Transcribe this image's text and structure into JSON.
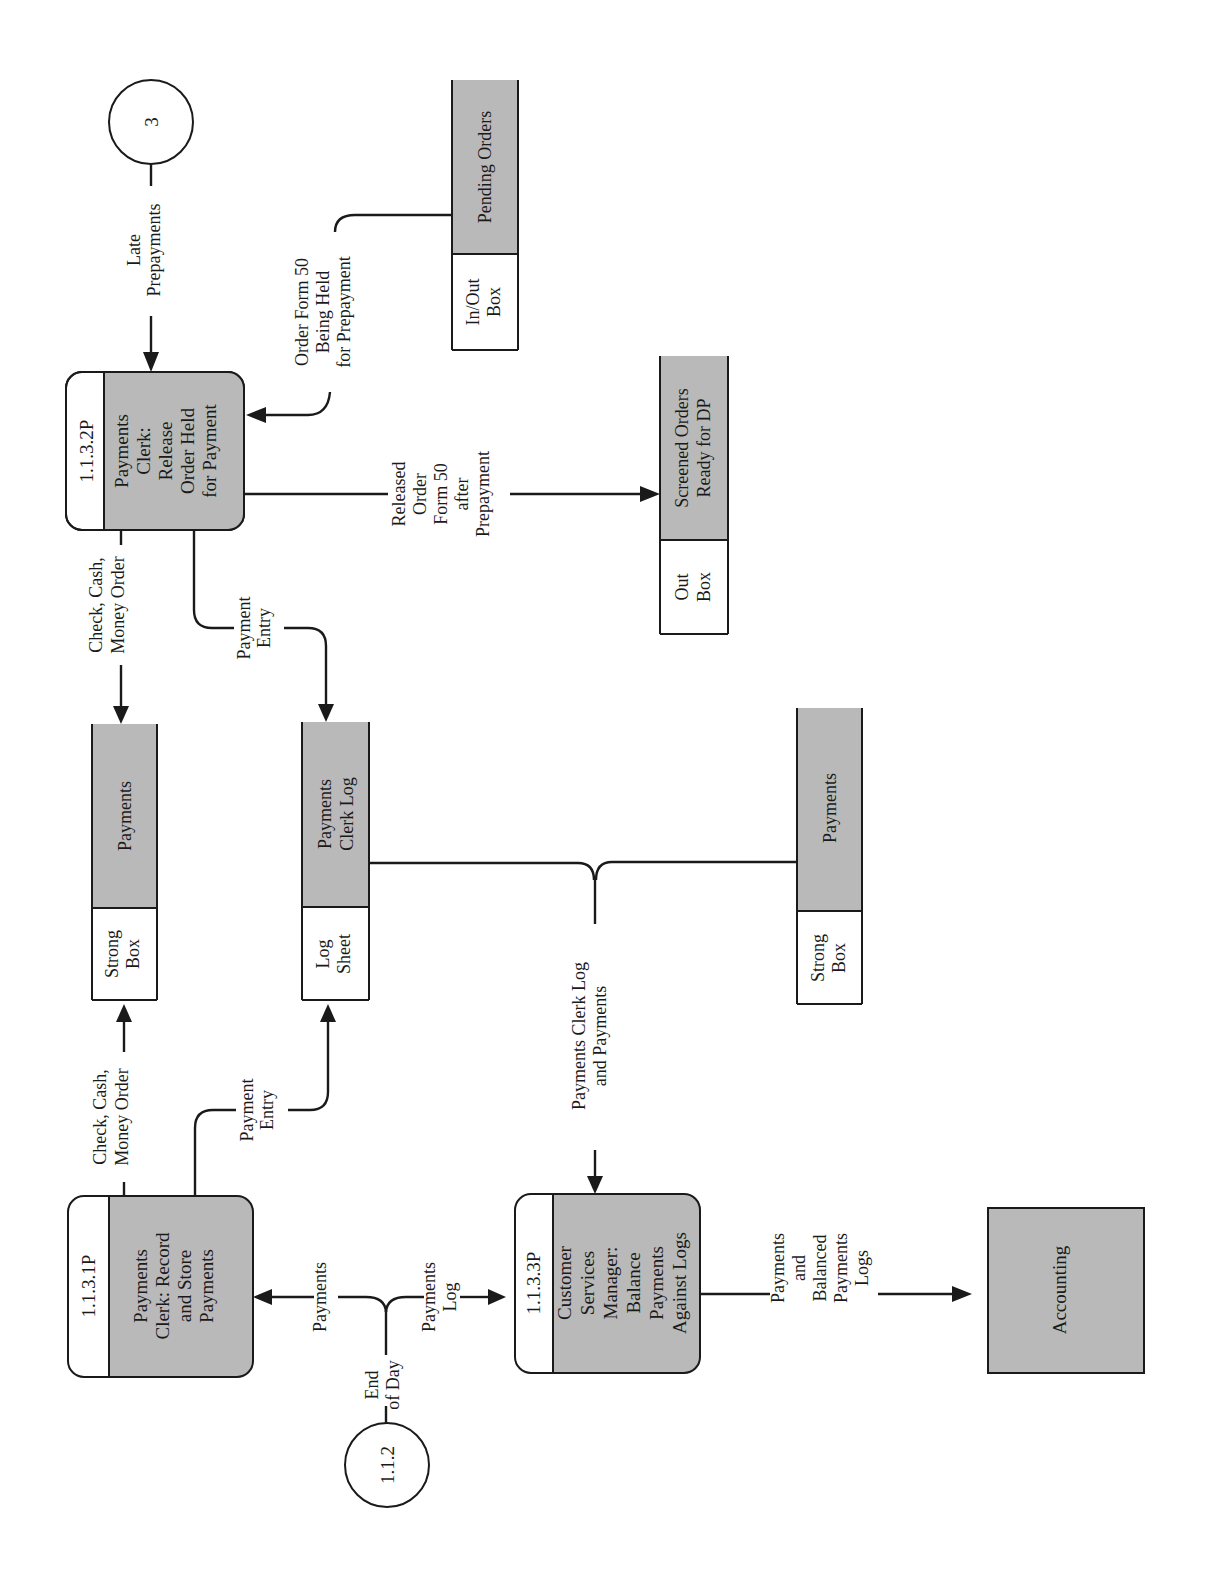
{
  "diagram": {
    "type": "data-flow-diagram",
    "orientation": "rotated-90-ccw",
    "colors": {
      "shade": "#b9b9b9",
      "line": "#1a1a1a",
      "background": "#ffffff"
    },
    "connectors": {
      "c3": {
        "label": "3"
      },
      "c112": {
        "label": "1.1.2"
      }
    },
    "processes": {
      "p1": {
        "id": "1.1.3.1P",
        "lines": [
          "Payments",
          "Clerk: Record",
          "and Store",
          "Payments"
        ]
      },
      "p2": {
        "id": "1.1.3.2P",
        "lines": [
          "Payments",
          "Clerk:",
          "Release",
          "Order Held",
          "for Payment"
        ]
      },
      "p3": {
        "id": "1.1.3.3P",
        "lines": [
          "Customer",
          "Services",
          "Manager:",
          "Balance",
          "Payments",
          "Against Logs"
        ]
      }
    },
    "stores": {
      "pending": {
        "id_lines": [
          "In/Out",
          "Box"
        ],
        "name_lines": [
          "Pending Orders"
        ]
      },
      "screened": {
        "id_lines": [
          "Out",
          "Box"
        ],
        "name_lines": [
          "Screened Orders",
          "Ready for DP"
        ]
      },
      "pay1": {
        "id_lines": [
          "Strong",
          "Box"
        ],
        "name_lines": [
          "Payments"
        ]
      },
      "log": {
        "id_lines": [
          "Log",
          "Sheet"
        ],
        "name_lines": [
          "Payments",
          "Clerk Log"
        ]
      },
      "pay2": {
        "id_lines": [
          "Strong",
          "Box"
        ],
        "name_lines": [
          "Payments"
        ]
      }
    },
    "externals": {
      "accounting": {
        "label": "Accounting"
      }
    },
    "flows": {
      "late_prepayments": {
        "lines": [
          "Late",
          "Prepayments"
        ]
      },
      "order_held": {
        "lines": [
          "Order Form 50",
          "Being Held",
          "for Prepayment"
        ]
      },
      "released_order": {
        "lines": [
          "Released",
          "Order",
          "Form 50",
          "after",
          "Prepayment"
        ]
      },
      "check_cash_2": {
        "lines": [
          "Check, Cash,",
          "Money Order"
        ]
      },
      "payment_entry_2": {
        "lines": [
          "Payment",
          "Entry"
        ]
      },
      "check_cash_1": {
        "lines": [
          "Check, Cash,",
          "Money Order"
        ]
      },
      "payment_entry_1": {
        "lines": [
          "Payment",
          "Entry"
        ]
      },
      "payments": {
        "lines": [
          "Payments"
        ]
      },
      "end_of_day": {
        "lines": [
          "End",
          "of Day"
        ]
      },
      "payments_log": {
        "lines": [
          "Payments",
          "Log"
        ]
      },
      "clerk_log_and_payments": {
        "lines": [
          "Payments Clerk Log",
          "and Payments"
        ]
      },
      "balanced_logs": {
        "lines": [
          "Payments",
          "and",
          "Balanced",
          "Payments",
          "Logs"
        ]
      }
    }
  }
}
